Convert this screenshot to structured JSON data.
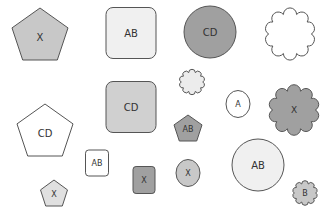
{
  "canvas": {
    "width": 332,
    "height": 217,
    "background": "#ffffff",
    "stroke": "#555555"
  },
  "shapes": [
    {
      "id": "s1",
      "type": "pentagon",
      "label": "X",
      "cx": 40,
      "cy": 34,
      "w": 56,
      "h": 52,
      "fill": "#c8c8c8",
      "font": 10
    },
    {
      "id": "s2",
      "type": "rounded-rect",
      "label": "AB",
      "cx": 131,
      "cy": 33,
      "w": 50,
      "h": 51,
      "fill": "#f0f0f0",
      "font": 10
    },
    {
      "id": "s3",
      "type": "circle",
      "label": "CD",
      "cx": 210,
      "cy": 32,
      "w": 52,
      "h": 52,
      "fill": "#a0a0a0",
      "font": 10
    },
    {
      "id": "s4",
      "type": "cloud",
      "label": "",
      "cx": 290,
      "cy": 34,
      "w": 52,
      "h": 50,
      "fill": "#ffffff",
      "font": 10
    },
    {
      "id": "s5",
      "type": "pentagon",
      "label": "CD",
      "cx": 45,
      "cy": 130,
      "w": 56,
      "h": 52,
      "fill": "#ffffff",
      "font": 10
    },
    {
      "id": "s6",
      "type": "rounded-rect",
      "label": "CD",
      "cx": 131,
      "cy": 107,
      "w": 50,
      "h": 51,
      "fill": "#d0d0d0",
      "font": 10
    },
    {
      "id": "s7",
      "type": "cloud",
      "label": "",
      "cx": 192,
      "cy": 82,
      "w": 26,
      "h": 24,
      "fill": "#ececec",
      "font": 8
    },
    {
      "id": "s8",
      "type": "circle",
      "label": "A",
      "cx": 238,
      "cy": 104,
      "w": 24,
      "h": 27,
      "fill": "#ffffff",
      "font": 8
    },
    {
      "id": "s9",
      "type": "cloud",
      "label": "X",
      "cx": 294,
      "cy": 110,
      "w": 52,
      "h": 48,
      "fill": "#a0a0a0",
      "font": 9
    },
    {
      "id": "s10",
      "type": "pentagon",
      "label": "AB",
      "cx": 188,
      "cy": 128,
      "w": 28,
      "h": 26,
      "fill": "#a0a0a0",
      "font": 8
    },
    {
      "id": "s11",
      "type": "rounded-rect",
      "label": "AB",
      "cx": 97,
      "cy": 163,
      "w": 23,
      "h": 26,
      "fill": "#ffffff",
      "font": 8
    },
    {
      "id": "s12",
      "type": "pentagon",
      "label": "X",
      "cx": 54,
      "cy": 193,
      "w": 27,
      "h": 26,
      "fill": "#e0e0e0",
      "font": 8
    },
    {
      "id": "s13",
      "type": "rounded-rect",
      "label": "X",
      "cx": 144,
      "cy": 180,
      "w": 22,
      "h": 27,
      "fill": "#a0a0a0",
      "font": 8
    },
    {
      "id": "s14",
      "type": "circle",
      "label": "X",
      "cx": 188,
      "cy": 173,
      "w": 24,
      "h": 27,
      "fill": "#c8c8c8",
      "font": 8
    },
    {
      "id": "s15",
      "type": "circle",
      "label": "AB",
      "cx": 258,
      "cy": 165,
      "w": 52,
      "h": 52,
      "fill": "#f0f0f0",
      "font": 10
    },
    {
      "id": "s16",
      "type": "cloud",
      "label": "B",
      "cx": 305,
      "cy": 193,
      "w": 26,
      "h": 23,
      "fill": "#c8c8c8",
      "font": 8
    }
  ]
}
